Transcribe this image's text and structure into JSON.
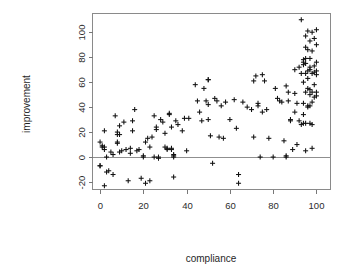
{
  "figure": {
    "background_color": "#ffffff",
    "marker_color": "#111111",
    "axis_color": "#787878",
    "frame_color": "#8a8a8a",
    "marker_symbol": "plus"
  },
  "chart_data": {
    "type": "scatter",
    "title": "",
    "subtitle": "",
    "xlabel": "compliance",
    "ylabel": "improvement",
    "xlim": [
      -3.5,
      106.5
    ],
    "ylim": [
      -26,
      115
    ],
    "xticks": [
      0,
      20,
      40,
      60,
      80,
      100
    ],
    "yticks": [
      -20,
      0,
      20,
      40,
      60,
      80,
      100
    ],
    "xtick_labels": [
      "0",
      "20",
      "40",
      "60",
      "80",
      "100"
    ],
    "ytick_labels": [
      "-20",
      "0",
      "20",
      "40",
      "60",
      "80",
      "100"
    ],
    "grid": false,
    "legend": null,
    "annotations": [
      {
        "type": "hline",
        "y": 0,
        "label": "zero reference line"
      }
    ],
    "series": [
      {
        "name": "observations",
        "marker": "+",
        "color": "#111111",
        "points": [
          [
            0,
            -7
          ],
          [
            0,
            -7
          ],
          [
            0,
            12
          ],
          [
            1,
            9
          ],
          [
            1,
            8
          ],
          [
            2,
            21
          ],
          [
            2,
            8
          ],
          [
            2,
            6
          ],
          [
            2,
            -23
          ],
          [
            3,
            0
          ],
          [
            3,
            -12
          ],
          [
            4,
            -11
          ],
          [
            5,
            4
          ],
          [
            6,
            2
          ],
          [
            6,
            -14
          ],
          [
            7,
            33
          ],
          [
            8,
            20
          ],
          [
            8,
            18
          ],
          [
            8,
            12
          ],
          [
            8,
            11
          ],
          [
            9,
            25
          ],
          [
            9,
            18
          ],
          [
            9,
            4
          ],
          [
            10,
            5
          ],
          [
            11,
            28
          ],
          [
            12,
            6
          ],
          [
            13,
            -19
          ],
          [
            14,
            3
          ],
          [
            14,
            7
          ],
          [
            15,
            21
          ],
          [
            15,
            29
          ],
          [
            16,
            38
          ],
          [
            17,
            5
          ],
          [
            18,
            6
          ],
          [
            19,
            -17
          ],
          [
            20,
            1
          ],
          [
            20,
            0
          ],
          [
            21,
            -21
          ],
          [
            21,
            12
          ],
          [
            22,
            15
          ],
          [
            23,
            8
          ],
          [
            23,
            -19
          ],
          [
            24,
            16
          ],
          [
            25,
            33
          ],
          [
            25,
            0
          ],
          [
            26,
            24
          ],
          [
            26,
            22
          ],
          [
            27,
            0
          ],
          [
            27,
            -1
          ],
          [
            28,
            30
          ],
          [
            29,
            28
          ],
          [
            30,
            19
          ],
          [
            30,
            8
          ],
          [
            31,
            7
          ],
          [
            31,
            6
          ],
          [
            32,
            34
          ],
          [
            32,
            35
          ],
          [
            33,
            6
          ],
          [
            33,
            7
          ],
          [
            33,
            24
          ],
          [
            34,
            -16
          ],
          [
            34,
            0
          ],
          [
            34,
            1
          ],
          [
            34,
            2
          ],
          [
            35,
            29
          ],
          [
            36,
            26
          ],
          [
            38,
            21
          ],
          [
            39,
            31
          ],
          [
            40,
            5
          ],
          [
            41,
            31
          ],
          [
            44,
            58
          ],
          [
            45,
            45
          ],
          [
            46,
            36
          ],
          [
            47,
            29
          ],
          [
            48,
            55
          ],
          [
            49,
            45
          ],
          [
            50,
            62
          ],
          [
            50,
            62
          ],
          [
            50,
            42
          ],
          [
            50,
            30
          ],
          [
            51,
            17
          ],
          [
            52,
            -5
          ],
          [
            53,
            47
          ],
          [
            54,
            45
          ],
          [
            55,
            16
          ],
          [
            56,
            41
          ],
          [
            57,
            15
          ],
          [
            58,
            44
          ],
          [
            60,
            30
          ],
          [
            62,
            46
          ],
          [
            63,
            23
          ],
          [
            64,
            -14
          ],
          [
            64,
            -21
          ],
          [
            66,
            44
          ],
          [
            68,
            40
          ],
          [
            70,
            38
          ],
          [
            71,
            61
          ],
          [
            71,
            16
          ],
          [
            72,
            65
          ],
          [
            73,
            43
          ],
          [
            73,
            41
          ],
          [
            74,
            0
          ],
          [
            75,
            66
          ],
          [
            75,
            36
          ],
          [
            76,
            61
          ],
          [
            77,
            38
          ],
          [
            78,
            15
          ],
          [
            80,
            0
          ],
          [
            81,
            55
          ],
          [
            82,
            47
          ],
          [
            83,
            45
          ],
          [
            84,
            44
          ],
          [
            85,
            13
          ],
          [
            86,
            0
          ],
          [
            86,
            1
          ],
          [
            86,
            57
          ],
          [
            87,
            52
          ],
          [
            87,
            45
          ],
          [
            88,
            29
          ],
          [
            88,
            30
          ],
          [
            89,
            6
          ],
          [
            90,
            70
          ],
          [
            90,
            51
          ],
          [
            90,
            36
          ],
          [
            91,
            43
          ],
          [
            91,
            10
          ],
          [
            92,
            72
          ],
          [
            92,
            29
          ],
          [
            93,
            110
          ],
          [
            93,
            67
          ],
          [
            93,
            26
          ],
          [
            94,
            76
          ],
          [
            94,
            78
          ],
          [
            94,
            74
          ],
          [
            94,
            60
          ],
          [
            94,
            43
          ],
          [
            94,
            34
          ],
          [
            94,
            27
          ],
          [
            95,
            97
          ],
          [
            95,
            88
          ],
          [
            95,
            79
          ],
          [
            95,
            75
          ],
          [
            95,
            67
          ],
          [
            95,
            52
          ],
          [
            95,
            27
          ],
          [
            95,
            5
          ],
          [
            96,
            101
          ],
          [
            96,
            86
          ],
          [
            96,
            69
          ],
          [
            96,
            63
          ],
          [
            96,
            55
          ],
          [
            96,
            41
          ],
          [
            96,
            40
          ],
          [
            97,
            93
          ],
          [
            97,
            79
          ],
          [
            97,
            72
          ],
          [
            97,
            70
          ],
          [
            97,
            54
          ],
          [
            97,
            50
          ],
          [
            97,
            41
          ],
          [
            97,
            27
          ],
          [
            98,
            100
          ],
          [
            98,
            85
          ],
          [
            98,
            67
          ],
          [
            98,
            52
          ],
          [
            98,
            44
          ],
          [
            98,
            26
          ],
          [
            98,
            7
          ],
          [
            99,
            95
          ],
          [
            99,
            73
          ],
          [
            99,
            68
          ],
          [
            99,
            58
          ],
          [
            99,
            48
          ],
          [
            100,
            102
          ],
          [
            100,
            90
          ],
          [
            100,
            76
          ],
          [
            100,
            69
          ],
          [
            100,
            66
          ],
          [
            100,
            52
          ],
          [
            100,
            49
          ]
        ]
      }
    ]
  }
}
